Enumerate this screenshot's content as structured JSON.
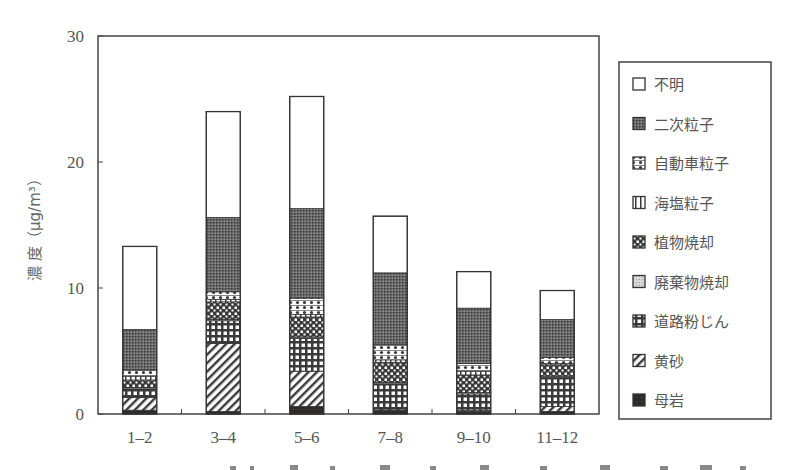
{
  "chart_data": {
    "type": "bar",
    "stacked": true,
    "title": "",
    "xlabel": "",
    "ylabel": "濃 度（μg/m³）",
    "ylim": [
      0,
      30
    ],
    "yticks": [
      0,
      10,
      20,
      30
    ],
    "grid": false,
    "legend_position": "right",
    "categories": [
      "1–2",
      "3–4",
      "5–6",
      "7–8",
      "9–10",
      "11–12"
    ],
    "series": [
      {
        "name": "母岩",
        "pattern": "solid-dark",
        "values": [
          0.3,
          0.2,
          0.6,
          0.3,
          0.2,
          0.2
        ]
      },
      {
        "name": "黄砂",
        "pattern": "diagonal",
        "values": [
          1.0,
          5.4,
          2.8,
          0.1,
          0.1,
          0.4
        ]
      },
      {
        "name": "道路粉じん",
        "pattern": "grid",
        "values": [
          0.7,
          1.8,
          2.6,
          2.0,
          1.3,
          2.3
        ]
      },
      {
        "name": "廃棄物焼却",
        "pattern": "light-dots",
        "values": [
          0.1,
          0.1,
          0.1,
          0.1,
          0.1,
          0.1
        ]
      },
      {
        "name": "植物焼却",
        "pattern": "checker",
        "values": [
          0.6,
          1.4,
          1.6,
          1.6,
          1.4,
          0.9
        ]
      },
      {
        "name": "海塩粒子",
        "pattern": "vertical",
        "values": [
          0.3,
          0.2,
          0.2,
          0.2,
          0.3,
          0.1
        ]
      },
      {
        "name": "自動車粒子",
        "pattern": "sparse-dots",
        "values": [
          0.5,
          0.6,
          1.3,
          1.2,
          0.6,
          0.5
        ]
      },
      {
        "name": "二次粒子",
        "pattern": "dense-dots",
        "values": [
          3.2,
          5.9,
          7.1,
          5.7,
          4.4,
          3.0
        ]
      },
      {
        "name": "不明",
        "pattern": "white",
        "values": [
          6.6,
          8.4,
          8.9,
          4.5,
          2.9,
          2.3
        ]
      }
    ],
    "totals": [
      13.3,
      24.0,
      25.2,
      15.7,
      11.3,
      9.8
    ],
    "legend_order": [
      "不明",
      "二次粒子",
      "自動車粒子",
      "海塩粒子",
      "植物焼却",
      "廃棄物焼却",
      "道路粉じん",
      "黄砂",
      "母岩"
    ]
  },
  "colors": {
    "axis": "#444444",
    "text": "#555555",
    "dark_fill": "#333333",
    "background": "#ffffff"
  }
}
